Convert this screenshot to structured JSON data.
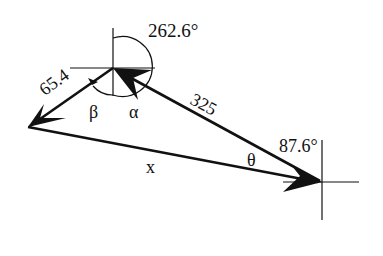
{
  "diagram": {
    "type": "vector-triangle",
    "labels": {
      "angle_top": "262.6°",
      "side_left": "65.4",
      "side_right": "325",
      "angle_right": "87.6°",
      "beta": "β",
      "alpha": "α",
      "theta": "θ",
      "resultant": "x"
    },
    "colors": {
      "stroke": "#111111",
      "background": "#ffffff"
    }
  }
}
